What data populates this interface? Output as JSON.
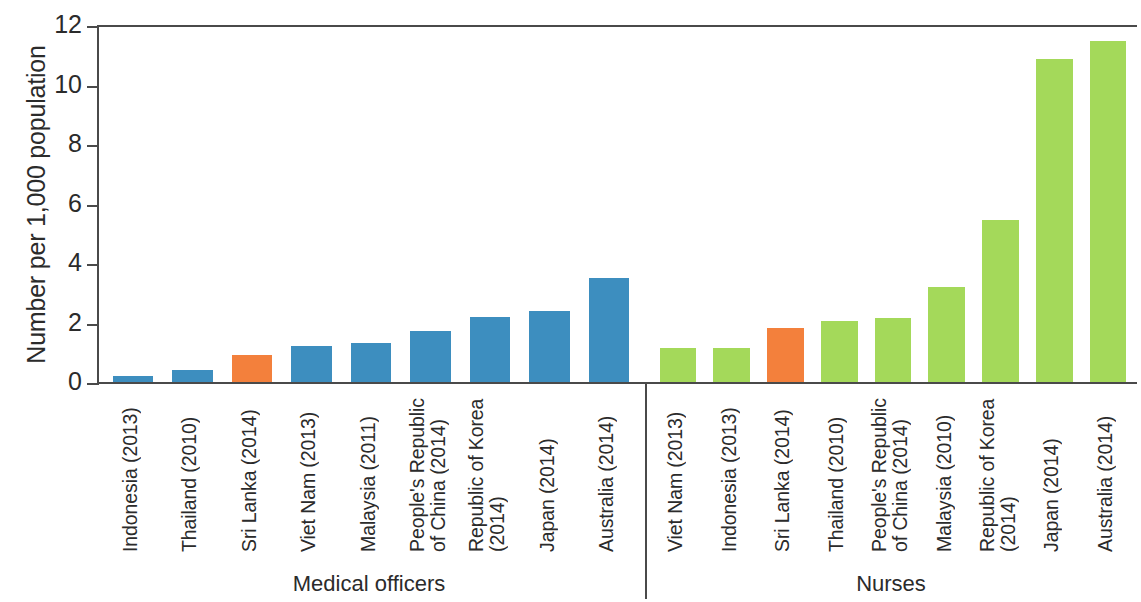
{
  "chart_data": {
    "type": "bar",
    "title": "",
    "xlabel": "",
    "ylabel": "Number per 1,000 population",
    "ylim": [
      0,
      12
    ],
    "yticks": [
      0,
      2,
      4,
      6,
      8,
      10,
      12
    ],
    "ytick_labels": [
      "0",
      "2",
      "4",
      "6",
      "8",
      "10",
      "12"
    ],
    "grid": false,
    "legend_position": "none",
    "colors": {
      "medical_officers": "#3d8ebf",
      "nurses": "#a4d95a",
      "highlight": "#f3803c",
      "axis": "#4a4a4a",
      "text": "#2b2b2b",
      "background": "#ffffff"
    },
    "groups": [
      {
        "name": "Medical officers",
        "color": "#3d8ebf",
        "categories": [
          "Indonesia (2013)",
          "Thailand (2010)",
          "Sri Lanka (2014)",
          "Viet Nam (2013)",
          "Malaysia (2011)",
          "People's Republic of China (2014)",
          "Republic of Korea (2014)",
          "Japan (2014)",
          "Australia (2014)"
        ],
        "category_lines": [
          [
            "Indonesia (2013)"
          ],
          [
            "Thailand (2010)"
          ],
          [
            "Sri Lanka (2014)"
          ],
          [
            "Viet Nam (2013)"
          ],
          [
            "Malaysia (2011)"
          ],
          [
            "People's Republic",
            "of China (2014)"
          ],
          [
            "Republic of Korea",
            "(2014)"
          ],
          [
            "Japan (2014)"
          ],
          [
            "Australia (2014)"
          ]
        ],
        "values": [
          0.2,
          0.4,
          0.9,
          1.2,
          1.3,
          1.7,
          2.2,
          2.4,
          3.5
        ],
        "highlighted": [
          "Sri Lanka (2014)"
        ]
      },
      {
        "name": "Nurses",
        "color": "#a4d95a",
        "categories": [
          "Viet Nam (2013)",
          "Indonesia (2013)",
          "Sri Lanka (2014)",
          "Thailand (2010)",
          "People's Republic of China (2014)",
          "Malaysia (2010)",
          "Republic of Korea (2014)",
          "Japan (2014)",
          "Australia (2014)"
        ],
        "category_lines": [
          [
            "Viet Nam (2013)"
          ],
          [
            "Indonesia (2013)"
          ],
          [
            "Sri Lanka (2014)"
          ],
          [
            "Thailand (2010)"
          ],
          [
            "People's Republic",
            "of China (2014)"
          ],
          [
            "Malaysia (2010)"
          ],
          [
            "Republic of Korea",
            "(2014)"
          ],
          [
            "Japan (2014)"
          ],
          [
            "Australia (2014)"
          ]
        ],
        "values": [
          1.15,
          1.15,
          1.8,
          2.05,
          2.15,
          3.2,
          5.45,
          10.85,
          11.45
        ],
        "highlighted": [
          "Sri Lanka (2014)"
        ]
      }
    ]
  }
}
